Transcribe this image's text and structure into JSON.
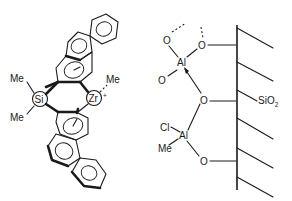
{
  "figure": {
    "left_structure": {
      "name": "Me2Si-bridged bis(benzindenyl) zirconocene methyl cation",
      "atoms": {
        "si": "Si",
        "zr": "Zr",
        "zr_charge": "+",
        "me_si_top": "Me",
        "me_si_bottom": "Me",
        "me_zr": "Me"
      }
    },
    "right_structure": {
      "name": "Silica-supported aluminum species",
      "atoms": {
        "al_top": "Al",
        "al_bottom": "Al",
        "o_top_left": "O",
        "o_top_right": "O",
        "o_al_top": "O",
        "o_middle": "O",
        "o_bottom": "O",
        "cl": "Cl",
        "me": "Me"
      },
      "surface_label": "SiO",
      "surface_label_subscript": "2"
    }
  }
}
